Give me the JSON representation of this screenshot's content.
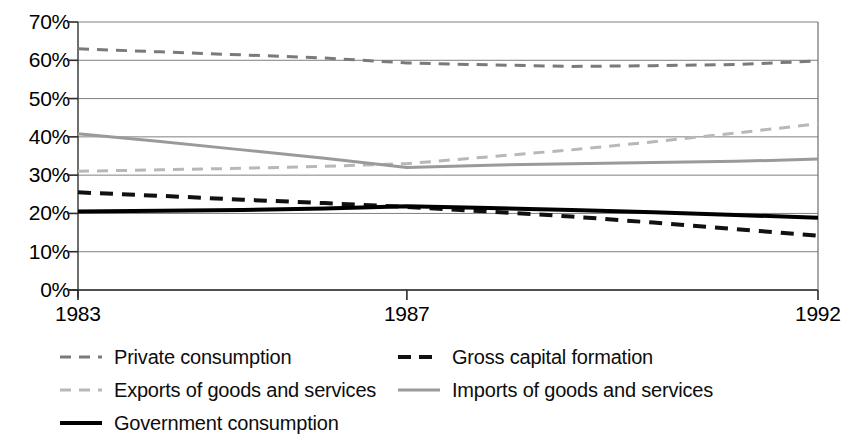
{
  "chart_data": {
    "type": "line",
    "title": "",
    "subtitle": "",
    "xlabel": "",
    "ylabel": "",
    "x": [
      1983,
      1984,
      1985,
      1986,
      1987,
      1988,
      1989,
      1990,
      1991,
      1992
    ],
    "xtick_labels": [
      "1983",
      "1987",
      "1992"
    ],
    "xtick_values": [
      1983,
      1987,
      1992
    ],
    "ytick_labels": [
      "0%",
      "10%",
      "20%",
      "30%",
      "40%",
      "50%",
      "60%",
      "70%"
    ],
    "ytick_values": [
      0,
      10,
      20,
      30,
      40,
      50,
      60,
      70
    ],
    "ylim": [
      0,
      70
    ],
    "xlim": [
      1983,
      1992
    ],
    "grid": true,
    "legend_position": "bottom",
    "series": [
      {
        "name": "Private consumption",
        "values": [
          63.0,
          62.2,
          61.4,
          60.6,
          59.3,
          58.8,
          58.4,
          58.6,
          58.9,
          59.8
        ],
        "color": "#7a7a7a",
        "style": "dashed",
        "width": 3
      },
      {
        "name": "Gross capital formation",
        "values": [
          25.5,
          24.6,
          23.6,
          22.7,
          21.7,
          20.5,
          19.2,
          17.6,
          15.9,
          14.2
        ],
        "color": "#111111",
        "style": "dashed",
        "width": 4
      },
      {
        "name": "Exports of goods and services",
        "values": [
          31.0,
          31.4,
          31.8,
          32.3,
          33.0,
          34.8,
          36.6,
          38.7,
          41.0,
          43.4
        ],
        "color": "#b8b8b8",
        "style": "dashed",
        "width": 3
      },
      {
        "name": "Imports of goods and services",
        "values": [
          40.8,
          38.8,
          36.6,
          34.4,
          32.0,
          32.6,
          33.0,
          33.3,
          33.6,
          34.2
        ],
        "color": "#9a9a9a",
        "style": "solid",
        "width": 3
      },
      {
        "name": "Government consumption",
        "values": [
          20.5,
          20.7,
          20.9,
          21.3,
          21.9,
          21.4,
          20.9,
          20.3,
          19.6,
          18.9
        ],
        "color": "#000000",
        "style": "solid",
        "width": 4
      }
    ]
  },
  "axes": {
    "ytick_labels": [
      "70%",
      "60%",
      "50%",
      "40%",
      "30%",
      "20%",
      "10%",
      "0%"
    ],
    "xtick_labels": [
      "1983",
      "1987",
      "1992"
    ]
  },
  "legend": {
    "items": [
      {
        "label": "Private consumption"
      },
      {
        "label": "Gross capital formation"
      },
      {
        "label": "Exports of goods and services"
      },
      {
        "label": "Imports of goods and services"
      },
      {
        "label": "Government consumption"
      }
    ]
  }
}
